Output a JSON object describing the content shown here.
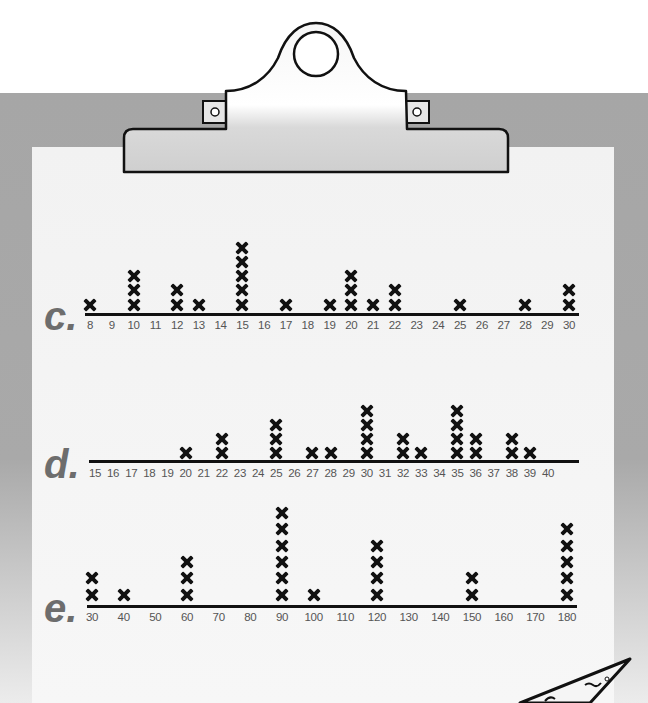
{
  "colors": {
    "board": "#a6a6a6",
    "paper": "#f4f4f4",
    "label": "#6d6d6d",
    "mark": "#111111",
    "tick_text": "#555555"
  },
  "icons": {
    "clip": "clipboard-clip-icon",
    "mark": "x-mark-icon",
    "pencil": "pencil-tip-icon"
  },
  "chart_data": [
    {
      "type": "dot_plot",
      "label": "c.",
      "title": "",
      "xlabel": "",
      "ylabel": "",
      "tick_labels": [
        "8",
        "9",
        "10",
        "11",
        "12",
        "13",
        "14",
        "15",
        "16",
        "17",
        "18",
        "19",
        "20",
        "21",
        "22",
        "23",
        "24",
        "25",
        "26",
        "27",
        "28",
        "29",
        "30"
      ],
      "xlim": [
        8,
        30
      ],
      "grid": false,
      "points": [
        {
          "x": 8,
          "count": 1
        },
        {
          "x": 10,
          "count": 3
        },
        {
          "x": 12,
          "count": 2
        },
        {
          "x": 13,
          "count": 1
        },
        {
          "x": 15,
          "count": 5
        },
        {
          "x": 17,
          "count": 1
        },
        {
          "x": 19,
          "count": 1
        },
        {
          "x": 20,
          "count": 3
        },
        {
          "x": 21,
          "count": 1
        },
        {
          "x": 22,
          "count": 2
        },
        {
          "x": 25,
          "count": 1
        },
        {
          "x": 28,
          "count": 1
        },
        {
          "x": 30,
          "count": 2
        }
      ]
    },
    {
      "type": "dot_plot",
      "label": "d.",
      "title": "",
      "xlabel": "",
      "ylabel": "",
      "tick_labels": [
        "15",
        "16",
        "17",
        "18",
        "19",
        "20",
        "21",
        "22",
        "23",
        "24",
        "25",
        "26",
        "27",
        "28",
        "29",
        "30",
        "31",
        "32",
        "33",
        "34",
        "35",
        "36",
        "37",
        "38",
        "39",
        "40"
      ],
      "xlim": [
        15,
        40
      ],
      "grid": false,
      "points": [
        {
          "x": 20,
          "count": 1
        },
        {
          "x": 22,
          "count": 2
        },
        {
          "x": 25,
          "count": 3
        },
        {
          "x": 27,
          "count": 1
        },
        {
          "x": 28,
          "count": 1
        },
        {
          "x": 30,
          "count": 4
        },
        {
          "x": 32,
          "count": 2
        },
        {
          "x": 33,
          "count": 1
        },
        {
          "x": 35,
          "count": 4
        },
        {
          "x": 36,
          "count": 2
        },
        {
          "x": 38,
          "count": 2
        },
        {
          "x": 39,
          "count": 1
        }
      ]
    },
    {
      "type": "dot_plot",
      "label": "e.",
      "title": "",
      "xlabel": "",
      "ylabel": "",
      "tick_labels": [
        "30",
        "40",
        "50",
        "60",
        "70",
        "80",
        "90",
        "100",
        "110",
        "120",
        "130",
        "140",
        "150",
        "160",
        "170",
        "180"
      ],
      "xlim": [
        30,
        180
      ],
      "grid": false,
      "points": [
        {
          "x": 30,
          "count": 2
        },
        {
          "x": 40,
          "count": 1
        },
        {
          "x": 60,
          "count": 3
        },
        {
          "x": 90,
          "count": 6
        },
        {
          "x": 100,
          "count": 1
        },
        {
          "x": 120,
          "count": 4
        },
        {
          "x": 150,
          "count": 2
        },
        {
          "x": 180,
          "count": 5
        }
      ]
    }
  ]
}
